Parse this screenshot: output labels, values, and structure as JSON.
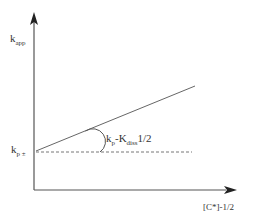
{
  "diagram": {
    "y_axis_label": {
      "main": "k",
      "sub": "app"
    },
    "x_axis_label": "[C*]-1/2",
    "intercept_label": {
      "main": "k",
      "sub": "p ±"
    },
    "slope_label": {
      "k": "k",
      "k_sub": "p",
      "sep": "-K",
      "K_sub": "diss",
      "tail": "1/2"
    },
    "colors": {
      "axis": "#555555",
      "line": "#666666",
      "text": "#333333"
    }
  }
}
